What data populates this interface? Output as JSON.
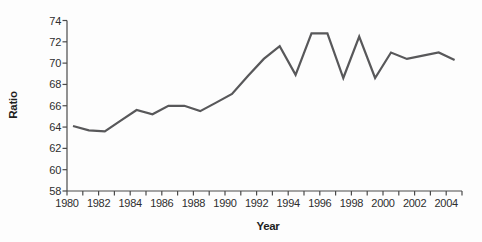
{
  "chart_data": {
    "type": "line",
    "title": "",
    "xlabel": "Year",
    "ylabel": "Ratio",
    "x": [
      1980,
      1981,
      1982,
      1983,
      1984,
      1985,
      1986,
      1987,
      1988,
      1989,
      1990,
      1991,
      1992,
      1993,
      1994,
      1995,
      1996,
      1997,
      1998,
      1999,
      2000,
      2001,
      2002,
      2003,
      2004
    ],
    "series": [
      {
        "name": "Ratio",
        "values": [
          64.1,
          63.7,
          63.6,
          64.6,
          65.6,
          65.2,
          66.0,
          66.0,
          65.5,
          66.3,
          67.1,
          68.8,
          70.4,
          71.6,
          68.9,
          72.8,
          72.8,
          68.6,
          72.5,
          68.6,
          71.0,
          70.4,
          70.7,
          71.0,
          70.3
        ]
      }
    ],
    "xlim": [
      1980,
      2005
    ],
    "ylim": [
      58,
      74
    ],
    "y_ticks": [
      58,
      60,
      62,
      64,
      66,
      68,
      70,
      72,
      74
    ],
    "y_tick_labels": [
      "58",
      "60",
      "62",
      "64",
      "66",
      "68",
      "70",
      "72",
      "74"
    ],
    "x_minor_tick_years": [
      1980,
      1981,
      1982,
      1983,
      1984,
      1985,
      1986,
      1987,
      1988,
      1989,
      1990,
      1991,
      1992,
      1993,
      1994,
      1995,
      1996,
      1997,
      1998,
      1999,
      2000,
      2001,
      2002,
      2003,
      2004,
      2005
    ],
    "x_tick_label_years": [
      1980,
      1982,
      1984,
      1986,
      1988,
      1990,
      1992,
      1994,
      1996,
      1998,
      2000,
      2002,
      2004
    ],
    "x_tick_labels": [
      "1980",
      "1982",
      "1984",
      "1986",
      "1988",
      "1990",
      "1992",
      "1994",
      "1996",
      "1998",
      "2000",
      "2002",
      "2004"
    ],
    "grid": false,
    "legend": false,
    "colors": {
      "line": "#58585a",
      "axis": "#4a4a4a",
      "tick_text": "#2e2e2e",
      "axis_title_text": "#1f1f1f",
      "background": "#fdfdfd"
    }
  }
}
